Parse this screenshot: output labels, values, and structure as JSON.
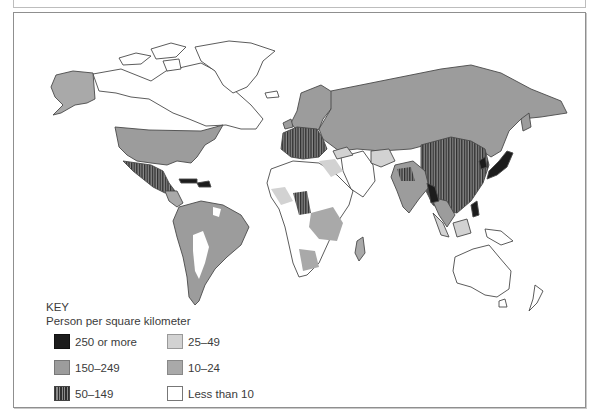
{
  "map": {
    "title": "",
    "key": {
      "heading": "KEY",
      "subtitle": "Person per square kilometer",
      "items": [
        {
          "label": "250 or more",
          "color": "#1c1c1c",
          "pattern": "solid"
        },
        {
          "label": "150–249",
          "color": "#9c9c9c",
          "pattern": "solid"
        },
        {
          "label": "50–149",
          "color": "#2e2e2e",
          "pattern": "vertical-stripes"
        },
        {
          "label": "25–49",
          "color": "#d2d2d2",
          "pattern": "solid"
        },
        {
          "label": "10–24",
          "color": "#a9a9a9",
          "pattern": "solid"
        },
        {
          "label": "Less than 10",
          "color": "#ffffff",
          "pattern": "solid"
        }
      ]
    },
    "colors": {
      "outline": "#4a4a4a",
      "frame": "#8f8f8f",
      "text": "#3b3b3b"
    }
  }
}
